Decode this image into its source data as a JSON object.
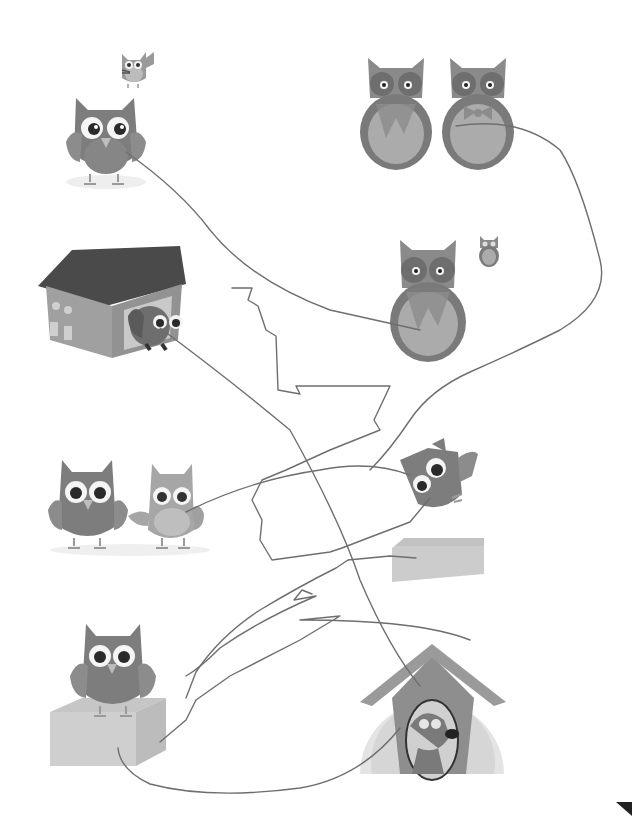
{
  "worksheet": {
    "type": "matching-activity",
    "colors": {
      "background": "#ffffff",
      "owl_dark": "#7a7a7a",
      "owl_mid": "#8e8e8e",
      "owl_light": "#a9a9a9",
      "owl_belly": "#b5b5b5",
      "eye_white": "#f4f4f4",
      "pupil": "#2a2a2a",
      "beak": "#bdbdbd",
      "box_front": "#cfcfcf",
      "box_side": "#bcbcbc",
      "box_top": "#c6c6c6",
      "roof": "#4a4a4a",
      "house_wall": "#9a9a9a",
      "pencil_line": "#6a6a6a",
      "corner_mark": "#222222"
    },
    "left_column": [
      {
        "id": "owl-with-small-owl",
        "label": "owl standing, small waving owl above"
      },
      {
        "id": "owl-in-house",
        "label": "owl peeking from a house"
      },
      {
        "id": "two-owls-holding-hands",
        "label": "two owls holding hands"
      },
      {
        "id": "owl-on-box",
        "label": "owl standing on a box"
      }
    ],
    "right_column": [
      {
        "id": "two-horned-owls",
        "label": "two horned owls, scarf and bow tie"
      },
      {
        "id": "horned-owl-with-small-owl",
        "label": "horned owl with scarf, small owl beside"
      },
      {
        "id": "flying-owl-over-box",
        "label": "owl flying above a box"
      },
      {
        "id": "dog-in-doghouse",
        "label": "dog peeking from a doghouse"
      }
    ],
    "connections": [
      {
        "from": "owl-with-small-owl",
        "to": "horned-owl-with-small-owl"
      },
      {
        "from": "owl-in-house",
        "to": "dog-in-doghouse"
      },
      {
        "from": "two-owls-holding-hands",
        "to": "flying-owl-over-box"
      },
      {
        "from": "owl-on-box",
        "to": "dog-in-doghouse"
      },
      {
        "from": "two-horned-owls",
        "to": "flying-owl-over-box"
      }
    ],
    "corner_mark": "triangle-marker"
  }
}
